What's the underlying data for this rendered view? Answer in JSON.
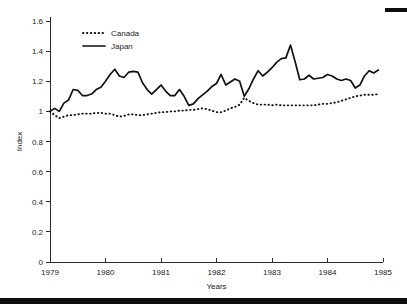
{
  "chart_data": {
    "type": "line",
    "title": "",
    "xlabel": "Years",
    "ylabel": "Index",
    "xlim": [
      1979,
      1985
    ],
    "ylim": [
      0,
      1.6
    ],
    "xticks": [
      1979,
      1980,
      1981,
      1982,
      1983,
      1984,
      1985
    ],
    "yticks": [
      0,
      0.2,
      0.4,
      0.6,
      0.8,
      1,
      1.2,
      1.4,
      1.6
    ],
    "xtick_labels": [
      "1979",
      "1980",
      "1981",
      "1982",
      "1983",
      "1984",
      "1985"
    ],
    "ytick_labels": [
      "0",
      "0.2",
      "0.4",
      "0.6",
      "0.8",
      "1",
      "1.2",
      "1.4",
      "1.6"
    ],
    "grid": false,
    "legend_position": "upper left",
    "series": [
      {
        "name": "Canada",
        "style": "dotted",
        "color": "#111111",
        "x": [
          1979.0,
          1979.083,
          1979.167,
          1979.25,
          1979.333,
          1979.417,
          1979.5,
          1979.583,
          1979.667,
          1979.75,
          1979.833,
          1979.917,
          1980.0,
          1980.083,
          1980.167,
          1980.25,
          1980.333,
          1980.417,
          1980.5,
          1980.583,
          1980.667,
          1980.75,
          1980.833,
          1980.917,
          1981.0,
          1981.083,
          1981.167,
          1981.25,
          1981.333,
          1981.417,
          1981.5,
          1981.583,
          1981.667,
          1981.75,
          1981.833,
          1981.917,
          1982.0,
          1982.083,
          1982.167,
          1982.25,
          1982.333,
          1982.417,
          1982.5,
          1982.583,
          1982.667,
          1982.75,
          1982.833,
          1982.917,
          1983.0,
          1983.083,
          1983.167,
          1983.25,
          1983.333,
          1983.417,
          1983.5,
          1983.583,
          1983.667,
          1983.75,
          1983.833,
          1983.917,
          1984.0,
          1984.083,
          1984.167,
          1984.25,
          1984.333,
          1984.417,
          1984.5,
          1984.583,
          1984.667,
          1984.75,
          1984.833,
          1984.917
        ],
        "values": [
          1.0,
          0.975,
          0.955,
          0.965,
          0.975,
          0.975,
          0.98,
          0.985,
          0.985,
          0.985,
          0.99,
          0.99,
          0.985,
          0.985,
          0.975,
          0.965,
          0.97,
          0.98,
          0.98,
          0.975,
          0.975,
          0.98,
          0.985,
          0.99,
          0.995,
          0.995,
          1.0,
          1.0,
          1.005,
          1.005,
          1.01,
          1.01,
          1.015,
          1.02,
          1.015,
          1.005,
          0.995,
          0.995,
          1.005,
          1.02,
          1.03,
          1.045,
          1.09,
          1.07,
          1.055,
          1.045,
          1.045,
          1.045,
          1.04,
          1.045,
          1.04,
          1.04,
          1.04,
          1.04,
          1.04,
          1.04,
          1.04,
          1.04,
          1.045,
          1.05,
          1.05,
          1.055,
          1.06,
          1.07,
          1.08,
          1.09,
          1.1,
          1.105,
          1.11,
          1.11,
          1.11,
          1.115
        ]
      },
      {
        "name": "Japan",
        "style": "solid",
        "color": "#111111",
        "x": [
          1979.0,
          1979.083,
          1979.167,
          1979.25,
          1979.333,
          1979.417,
          1979.5,
          1979.583,
          1979.667,
          1979.75,
          1979.833,
          1979.917,
          1980.0,
          1980.083,
          1980.167,
          1980.25,
          1980.333,
          1980.417,
          1980.5,
          1980.583,
          1980.667,
          1980.75,
          1980.833,
          1980.917,
          1981.0,
          1981.083,
          1981.167,
          1981.25,
          1981.333,
          1981.417,
          1981.5,
          1981.583,
          1981.667,
          1981.75,
          1981.833,
          1981.917,
          1982.0,
          1982.083,
          1982.167,
          1982.25,
          1982.333,
          1982.417,
          1982.5,
          1982.583,
          1982.667,
          1982.75,
          1982.833,
          1982.917,
          1983.0,
          1983.083,
          1983.167,
          1983.25,
          1983.333,
          1983.417,
          1983.5,
          1983.583,
          1983.667,
          1983.75,
          1983.833,
          1983.917,
          1984.0,
          1984.083,
          1984.167,
          1984.25,
          1984.333,
          1984.417,
          1984.5,
          1984.583,
          1984.667,
          1984.75,
          1984.833,
          1984.917
        ],
        "values": [
          1.0,
          1.02,
          1.0,
          1.055,
          1.075,
          1.145,
          1.14,
          1.105,
          1.105,
          1.115,
          1.145,
          1.16,
          1.2,
          1.245,
          1.28,
          1.235,
          1.225,
          1.26,
          1.265,
          1.26,
          1.19,
          1.145,
          1.115,
          1.145,
          1.175,
          1.135,
          1.105,
          1.105,
          1.145,
          1.1,
          1.04,
          1.05,
          1.085,
          1.11,
          1.135,
          1.165,
          1.185,
          1.245,
          1.175,
          1.195,
          1.215,
          1.2,
          1.1,
          1.15,
          1.215,
          1.27,
          1.235,
          1.26,
          1.29,
          1.325,
          1.35,
          1.355,
          1.44,
          1.33,
          1.21,
          1.215,
          1.24,
          1.215,
          1.22,
          1.225,
          1.245,
          1.235,
          1.215,
          1.205,
          1.215,
          1.205,
          1.155,
          1.175,
          1.235,
          1.27,
          1.255,
          1.275
        ]
      }
    ]
  },
  "axes": {
    "ylabel": "Index",
    "xlabel": "Years"
  },
  "legend": {
    "items": [
      {
        "label": "Canada",
        "marker": "dotted-line-swatch"
      },
      {
        "label": "Japan",
        "marker": "solid-line-swatch"
      }
    ]
  },
  "artifacts": {
    "top_right_bar": "scan-artifact-bar",
    "bottom_band": "scan-artifact-band"
  }
}
